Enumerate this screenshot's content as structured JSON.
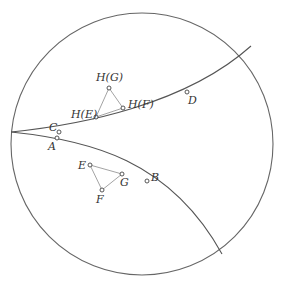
{
  "diagram": {
    "disk": {
      "cx": 142,
      "cy": 144,
      "r": 131,
      "stroke": "#666666"
    },
    "geodesics": [
      {
        "name": "upper-geodesic",
        "path": "M11,132 C80,125 185,105 251,46"
      },
      {
        "name": "lower-geodesic",
        "path": "M11,132 C90,140 170,160 222,254"
      }
    ],
    "points": [
      {
        "id": "A",
        "label": "A",
        "x": 57,
        "y": 138,
        "lx": 48,
        "ly": 150
      },
      {
        "id": "C",
        "label": "C",
        "x": 59,
        "y": 132,
        "lx": 49,
        "ly": 131
      },
      {
        "id": "D",
        "label": "D",
        "x": 187,
        "y": 92,
        "lx": 188,
        "ly": 104
      },
      {
        "id": "B",
        "label": "B",
        "x": 147,
        "y": 181,
        "lx": 151,
        "ly": 181
      },
      {
        "id": "E",
        "label": "E",
        "x": 90,
        "y": 165,
        "lx": 78,
        "ly": 169
      },
      {
        "id": "G",
        "label": "G",
        "x": 122,
        "y": 174,
        "lx": 120,
        "ly": 186
      },
      {
        "id": "F",
        "label": "F",
        "x": 102,
        "y": 190,
        "lx": 96,
        "ly": 203
      },
      {
        "id": "HG",
        "label": "H(G)",
        "x": 109,
        "y": 88,
        "lx": 96,
        "ly": 81
      },
      {
        "id": "HE",
        "label": "H(E)",
        "x": 96,
        "y": 117,
        "lx": 71,
        "ly": 118
      },
      {
        "id": "HF",
        "label": "H(F)",
        "x": 123,
        "y": 108,
        "lx": 128,
        "ly": 108
      }
    ],
    "triangles": [
      {
        "name": "triangle-EFG",
        "points": "90,165 122,174 102,190"
      },
      {
        "name": "triangle-HEHFHG",
        "points": "96,117 109,88 123,108"
      }
    ]
  }
}
